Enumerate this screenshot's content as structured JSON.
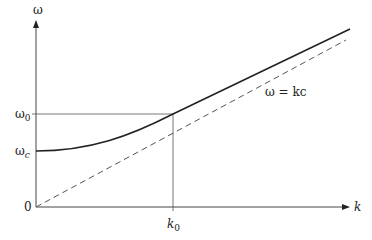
{
  "diagram": {
    "type": "dispersion-relation",
    "axes": {
      "y_label": "ω",
      "x_label": "k",
      "origin_label": "0"
    },
    "y_ticks": [
      {
        "label": "ω",
        "sub": "0",
        "name": "omega-0"
      },
      {
        "label": "ω",
        "sub": "c",
        "name": "omega-c"
      }
    ],
    "x_ticks": [
      {
        "label": "k",
        "sub": "0",
        "name": "k-0"
      }
    ],
    "asymptote_label": "ω = kc",
    "curves": [
      {
        "name": "dispersion-curve",
        "style": "solid",
        "color": "#222222"
      },
      {
        "name": "light-line",
        "style": "dashed",
        "color": "#555555"
      }
    ]
  }
}
